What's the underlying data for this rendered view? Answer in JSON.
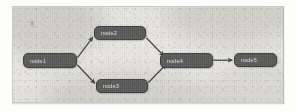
{
  "figure": {
    "caption": "",
    "background_color": "#e9e8e4",
    "frame_color": "#c9c8c4",
    "node_fill_color": "#4d4d4d",
    "node_text_color": "#d8d8d8",
    "edge_color": "#1f1f1f"
  },
  "diagram": {
    "type": "directed-acyclic-graph",
    "nodes": [
      {
        "id": "node1",
        "label": "node1",
        "x": 10,
        "y": 46,
        "w": 54,
        "h": 15
      },
      {
        "id": "node2",
        "label": "node2",
        "x": 81,
        "y": 19,
        "w": 52,
        "h": 14
      },
      {
        "id": "node3",
        "label": "node3",
        "x": 83,
        "y": 72,
        "w": 52,
        "h": 14
      },
      {
        "id": "node4",
        "label": "node4",
        "x": 147,
        "y": 46,
        "w": 53,
        "h": 15
      },
      {
        "id": "node5",
        "label": "node5",
        "x": 221,
        "y": 46,
        "w": 43,
        "h": 14
      }
    ],
    "edges": [
      {
        "from": "node1",
        "to": "node2"
      },
      {
        "from": "node1",
        "to": "node3"
      },
      {
        "from": "node2",
        "to": "node4"
      },
      {
        "from": "node3",
        "to": "node4"
      },
      {
        "from": "node4",
        "to": "node5"
      }
    ]
  }
}
